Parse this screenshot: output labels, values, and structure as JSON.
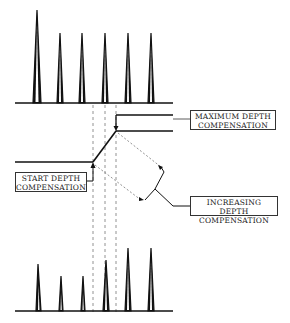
{
  "diagram": {
    "title": "",
    "labels": {
      "maximum": {
        "line1": "MAXIMUM DEPTH",
        "line2": "COMPENSATION"
      },
      "start": {
        "line1": "START DEPTH",
        "line2": "COMPENSATION"
      },
      "increasing": {
        "line1": "INCREASING DEPTH",
        "line2": "COMPENSATION"
      }
    },
    "top_trace": {
      "baseline_y": 103,
      "peaks": [
        {
          "x": 37,
          "top": 10
        },
        {
          "x": 60,
          "top": 33
        },
        {
          "x": 82,
          "top": 33
        },
        {
          "x": 105,
          "top": 33
        },
        {
          "x": 128,
          "top": 33
        },
        {
          "x": 151,
          "top": 33
        }
      ]
    },
    "bottom_trace": {
      "baseline_y": 311,
      "peaks": [
        {
          "x": 38,
          "top": 264
        },
        {
          "x": 61,
          "top": 276
        },
        {
          "x": 83,
          "top": 276
        },
        {
          "x": 106,
          "top": 260
        },
        {
          "x": 128,
          "top": 248
        },
        {
          "x": 151,
          "top": 248
        }
      ]
    },
    "colors": {
      "line": "#111111",
      "dashed": "#777777",
      "background": "#ffffff"
    }
  }
}
